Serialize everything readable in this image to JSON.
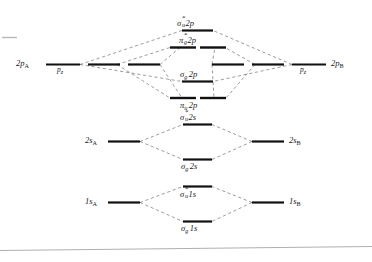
{
  "figure": {
    "type": "mo-energy-level-diagram",
    "ink_color": "#111111",
    "correlation_line_color": "#555555",
    "background": "#ffffff"
  },
  "atomic_left": {
    "p_group_label": "2p",
    "p_group_sub": "A",
    "p_orbital_label": "p",
    "p_orbital_sub": "z",
    "s2_label": "2s",
    "s2_sub": "A",
    "s1_label": "1s",
    "s1_sub": "A"
  },
  "atomic_right": {
    "p_group_label": "2p",
    "p_group_sub": "B",
    "p_orbital_label": "p",
    "p_orbital_sub": "z",
    "s2_label": "2s",
    "s2_sub": "B",
    "s1_label": "1s",
    "s1_sub": "B"
  },
  "molecular_orbitals": [
    {
      "id": "sigma-u-star-2p",
      "symbol": "σ",
      "sub": "u",
      "star": "*",
      "shell": "2p",
      "energy_rank": 1
    },
    {
      "id": "pi-g-star-2p",
      "symbol": "π",
      "sub": "g",
      "star": "*",
      "shell": "2p",
      "energy_rank": 2,
      "degeneracy": 2
    },
    {
      "id": "sigma-g-2p",
      "symbol": "σ",
      "sub": "g",
      "star": "",
      "shell": "2p",
      "energy_rank": 3
    },
    {
      "id": "pi-u-2p",
      "symbol": "π",
      "sub": "u",
      "star": "",
      "shell": "2p",
      "energy_rank": 4,
      "degeneracy": 2
    },
    {
      "id": "sigma-u-star-2s",
      "symbol": "σ",
      "sub": "u",
      "star": "*",
      "shell": "2s",
      "energy_rank": 5
    },
    {
      "id": "sigma-g-2s",
      "symbol": "σ",
      "sub": "g",
      "star": "",
      "shell": "2s",
      "energy_rank": 6
    },
    {
      "id": "sigma-u-star-1s",
      "symbol": "σ",
      "sub": "u",
      "star": "*",
      "shell": "1s",
      "energy_rank": 7
    },
    {
      "id": "sigma-g-1s",
      "symbol": "σ",
      "sub": "g",
      "star": "",
      "shell": "1s",
      "energy_rank": 8
    }
  ]
}
